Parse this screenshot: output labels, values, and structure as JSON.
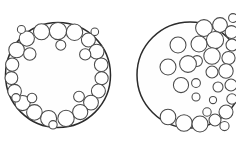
{
  "figure": {
    "background_color": "#ffffff",
    "width": 236,
    "height": 147,
    "boundary_stroke_color": "#2b2b2b",
    "boundary_fill_color": "#fefefe",
    "packed_stroke_color": "#4a4a4a",
    "packed_fill_color": "#ffffff",
    "boundary_stroke_width": 1.5,
    "packed_stroke_width": 1.05
  },
  "panels": [
    {
      "id": "left-panel",
      "name": "annular-ring-packing",
      "description": "Large outline circle with small circles arranged in a single ring around the inner perimeter, leaving an empty central region",
      "boundary": {
        "cx": 58,
        "cy": 75,
        "r": 52.5
      },
      "packed_circles": [
        {
          "cx": 58.0,
          "cy": 31.0,
          "r": 8.6
        },
        {
          "cx": 41.5,
          "cy": 31.8,
          "r": 8.0
        },
        {
          "cx": 74.5,
          "cy": 32.2,
          "r": 8.2
        },
        {
          "cx": 26.8,
          "cy": 38.6,
          "r": 7.6
        },
        {
          "cx": 88.4,
          "cy": 40.0,
          "r": 7.0
        },
        {
          "cx": 16.6,
          "cy": 50.0,
          "r": 7.8
        },
        {
          "cx": 96.6,
          "cy": 51.6,
          "r": 7.4
        },
        {
          "cx": 12.2,
          "cy": 64.6,
          "r": 6.6
        },
        {
          "cx": 101.2,
          "cy": 64.8,
          "r": 6.8
        },
        {
          "cx": 11.4,
          "cy": 78.0,
          "r": 6.4
        },
        {
          "cx": 101.6,
          "cy": 78.2,
          "r": 6.6
        },
        {
          "cx": 14.6,
          "cy": 91.2,
          "r": 6.8
        },
        {
          "cx": 98.4,
          "cy": 91.0,
          "r": 7.0
        },
        {
          "cx": 22.6,
          "cy": 103.0,
          "r": 7.6
        },
        {
          "cx": 91.0,
          "cy": 102.6,
          "r": 7.4
        },
        {
          "cx": 34.4,
          "cy": 112.4,
          "r": 7.8
        },
        {
          "cx": 80.2,
          "cy": 112.0,
          "r": 7.6
        },
        {
          "cx": 48.6,
          "cy": 118.4,
          "r": 8.0
        },
        {
          "cx": 66.0,
          "cy": 118.4,
          "r": 8.2
        },
        {
          "cx": 29.8,
          "cy": 54.0,
          "r": 6.2
        },
        {
          "cx": 85.2,
          "cy": 54.4,
          "r": 5.6
        },
        {
          "cx": 32.0,
          "cy": 98.0,
          "r": 4.8
        },
        {
          "cx": 79.0,
          "cy": 96.6,
          "r": 5.4
        },
        {
          "cx": 60.8,
          "cy": 45.2,
          "r": 5.0
        },
        {
          "cx": 16.0,
          "cy": 97.8,
          "r": 4.2
        },
        {
          "cx": 94.8,
          "cy": 31.8,
          "r": 3.8
        },
        {
          "cx": 21.4,
          "cy": 29.4,
          "r": 4.0
        },
        {
          "cx": 53.0,
          "cy": 124.8,
          "r": 4.2
        }
      ]
    },
    {
      "id": "right-panel",
      "name": "clustered-heterogeneous-packing",
      "description": "Large outline circle cropped at the right image edge, with circles densely clustered in the upper-right and along the bottom, and sparser scattered circles through the middle",
      "boundary": {
        "cx": 190,
        "cy": 75,
        "r": 53
      },
      "packed_circles": [
        {
          "cx": 204.0,
          "cy": 28.0,
          "r": 8.4
        },
        {
          "cx": 220.0,
          "cy": 25.0,
          "r": 7.4
        },
        {
          "cx": 231.5,
          "cy": 32.0,
          "r": 6.4
        },
        {
          "cx": 215.0,
          "cy": 40.0,
          "r": 8.6
        },
        {
          "cx": 232.0,
          "cy": 45.0,
          "r": 6.0
        },
        {
          "cx": 199.0,
          "cy": 44.0,
          "r": 8.0
        },
        {
          "cx": 212.0,
          "cy": 56.0,
          "r": 8.2
        },
        {
          "cx": 228.5,
          "cy": 58.0,
          "r": 6.6
        },
        {
          "cx": 197.0,
          "cy": 61.0,
          "r": 5.4
        },
        {
          "cx": 226.0,
          "cy": 71.0,
          "r": 7.2
        },
        {
          "cx": 212.0,
          "cy": 72.0,
          "r": 6.0
        },
        {
          "cx": 231.0,
          "cy": 85.0,
          "r": 6.0
        },
        {
          "cx": 218.0,
          "cy": 87.0,
          "r": 5.0
        },
        {
          "cx": 178.0,
          "cy": 45.0,
          "r": 8.0
        },
        {
          "cx": 188.0,
          "cy": 64.0,
          "r": 8.4
        },
        {
          "cx": 168.0,
          "cy": 67.0,
          "r": 8.0
        },
        {
          "cx": 181.0,
          "cy": 85.0,
          "r": 7.6
        },
        {
          "cx": 196.0,
          "cy": 83.0,
          "r": 4.4
        },
        {
          "cx": 196.0,
          "cy": 97.0,
          "r": 4.0
        },
        {
          "cx": 213.0,
          "cy": 100.0,
          "r": 3.6
        },
        {
          "cx": 168.0,
          "cy": 117.0,
          "r": 7.8
        },
        {
          "cx": 184.0,
          "cy": 123.0,
          "r": 8.2
        },
        {
          "cx": 200.0,
          "cy": 124.0,
          "r": 8.0
        },
        {
          "cx": 215.0,
          "cy": 120.0,
          "r": 6.0
        },
        {
          "cx": 226.0,
          "cy": 112.0,
          "r": 7.0
        },
        {
          "cx": 232.0,
          "cy": 99.0,
          "r": 5.2
        },
        {
          "cx": 224.5,
          "cy": 126.0,
          "r": 4.6
        },
        {
          "cx": 207.0,
          "cy": 112.0,
          "r": 4.2
        },
        {
          "cx": 233.0,
          "cy": 18.0,
          "r": 4.4
        }
      ]
    }
  ]
}
